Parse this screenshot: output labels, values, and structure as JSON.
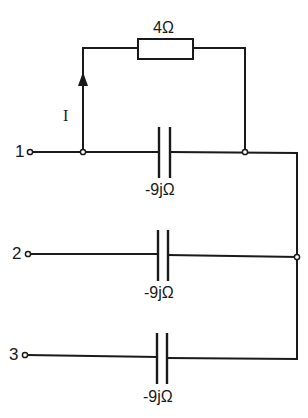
{
  "diagram": {
    "type": "circuit-schematic",
    "colors": {
      "line": "#1a1a1a",
      "background": "#ffffff"
    },
    "terminals": [
      {
        "id": "1",
        "label": "1"
      },
      {
        "id": "2",
        "label": "2"
      },
      {
        "id": "3",
        "label": "3"
      }
    ],
    "components": {
      "resistor": {
        "label": "4Ω",
        "value": "4Ω"
      },
      "capacitors": [
        {
          "branch": "1",
          "label": "-9jΩ"
        },
        {
          "branch": "2",
          "label": "-9jΩ"
        },
        {
          "branch": "3",
          "label": "-9jΩ"
        }
      ]
    },
    "current": {
      "label": "I",
      "direction": "up"
    }
  }
}
